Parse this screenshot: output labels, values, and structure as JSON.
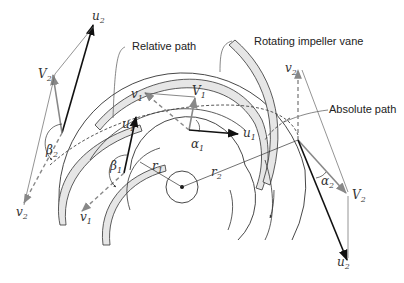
{
  "diagram": {
    "labels": {
      "relative_path": "Relative path",
      "rotating_vane": "Rotating impeller vane",
      "absolute_path": "Absolute path"
    },
    "symbols": {
      "u2_top": {
        "base": "u",
        "sub": "2"
      },
      "V2_left": {
        "base": "V",
        "sub": "2"
      },
      "beta2": {
        "base": "β",
        "sub": "2"
      },
      "v2_left": {
        "base": "v",
        "sub": "2"
      },
      "v1_top": {
        "base": "v",
        "sub": "1"
      },
      "V1": {
        "base": "V",
        "sub": "1"
      },
      "u1_center": {
        "base": "u",
        "sub": "1"
      },
      "alpha1": {
        "base": "α",
        "sub": "1"
      },
      "u1_left": {
        "base": "u",
        "sub": "1"
      },
      "beta1": {
        "base": "β",
        "sub": "1"
      },
      "r1": {
        "base": "r",
        "sub": "1"
      },
      "r2": {
        "base": "r",
        "sub": "2"
      },
      "v1_bottom": {
        "base": "v",
        "sub": "1"
      },
      "v2_right": {
        "base": "v",
        "sub": "2"
      },
      "alpha2": {
        "base": "α",
        "sub": "2"
      },
      "V2_right": {
        "base": "V",
        "sub": "2"
      },
      "u2_bottom": {
        "base": "u",
        "sub": "2"
      }
    },
    "colors": {
      "line": "#222222",
      "vector_gray": "#808080",
      "vane_fill": "#e6e6e6"
    }
  }
}
